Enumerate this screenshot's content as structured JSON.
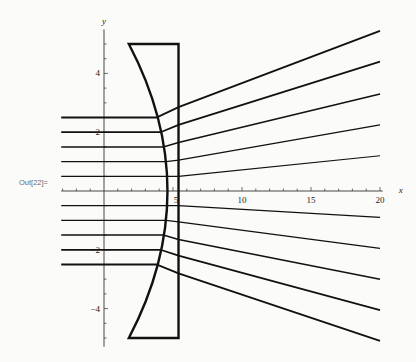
{
  "cell_label": "Out[22]=",
  "chart_data": {
    "type": "line",
    "title": "",
    "xlabel": "x",
    "ylabel": "y",
    "xlim": [
      -5,
      20
    ],
    "ylim": [
      -5.2,
      5.4
    ],
    "grid": false,
    "x_ticks": [
      5,
      10,
      15,
      20
    ],
    "x_tick_labels": [
      "5",
      "10",
      "15",
      "20"
    ],
    "y_ticks": [
      -4,
      -2,
      2,
      4
    ],
    "y_tick_labels": [
      "-4",
      "-2",
      "2",
      "4"
    ],
    "lens": {
      "shape": "plano-concave",
      "top_y": 5,
      "bottom_y": -5,
      "flat_face_x": 5.4,
      "curved_face_x_at_edge": 1.8,
      "curved_face_x_at_center": 4.6
    },
    "series": [
      {
        "name": "ray y=2.5",
        "incoming_y": 2.5,
        "x": [
          -3.1,
          3.8,
          5.4,
          20
        ],
        "y": [
          2.5,
          2.5,
          2.85,
          5.45
        ]
      },
      {
        "name": "ray y=2.0",
        "incoming_y": 2.0,
        "x": [
          -3.1,
          4.1,
          5.4,
          20
        ],
        "y": [
          2.0,
          2.0,
          2.25,
          4.4
        ]
      },
      {
        "name": "ray y=1.5",
        "incoming_y": 1.5,
        "x": [
          -3.1,
          4.3,
          5.4,
          20
        ],
        "y": [
          1.5,
          1.5,
          1.65,
          3.3
        ]
      },
      {
        "name": "ray y=1.0",
        "incoming_y": 1.0,
        "x": [
          -3.1,
          4.5,
          5.4,
          20
        ],
        "y": [
          1.0,
          1.0,
          1.05,
          2.25
        ]
      },
      {
        "name": "ray y=0.5",
        "incoming_y": 0.5,
        "x": [
          -3.1,
          4.6,
          5.4,
          20
        ],
        "y": [
          0.5,
          0.5,
          0.5,
          1.2
        ]
      },
      {
        "name": "ray y=-0.5",
        "incoming_y": -0.5,
        "x": [
          -3.1,
          4.6,
          5.4,
          20
        ],
        "y": [
          -0.5,
          -0.5,
          -0.5,
          -0.9
        ]
      },
      {
        "name": "ray y=-1.0",
        "incoming_y": -1.0,
        "x": [
          -3.1,
          4.5,
          5.4,
          20
        ],
        "y": [
          -1.0,
          -1.0,
          -1.05,
          -1.95
        ]
      },
      {
        "name": "ray y=-1.5",
        "incoming_y": -1.5,
        "x": [
          -3.1,
          4.3,
          5.4,
          20
        ],
        "y": [
          -1.5,
          -1.5,
          -1.65,
          -3.0
        ]
      },
      {
        "name": "ray y=-2.0",
        "incoming_y": -2.0,
        "x": [
          -3.1,
          4.1,
          5.4,
          20
        ],
        "y": [
          -2.0,
          -2.0,
          -2.2,
          -4.05
        ]
      },
      {
        "name": "ray y=-2.5",
        "incoming_y": -2.5,
        "x": [
          -3.1,
          3.8,
          5.4,
          20
        ],
        "y": [
          -2.5,
          -2.5,
          -2.8,
          -5.1
        ]
      }
    ]
  }
}
